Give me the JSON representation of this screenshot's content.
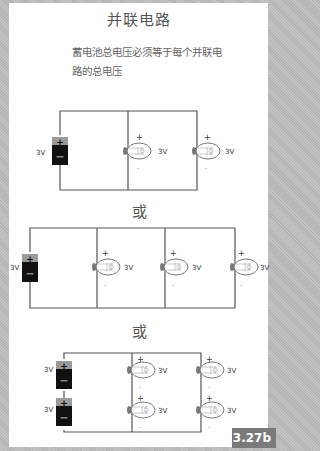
{
  "title": "并联电路",
  "description": "蓄电池总电压必须等于每个并联电路的总电压",
  "separator_label_1": "或",
  "separator_label_2": "或",
  "figure_number": "3.27b",
  "circuits": [
    {
      "name": "circuit-1",
      "batteries": [
        {
          "voltage": "3V"
        }
      ],
      "bulbs": [
        {
          "voltage": "3V"
        },
        {
          "voltage": "3V"
        }
      ]
    },
    {
      "name": "circuit-2",
      "batteries": [
        {
          "voltage": "3V"
        }
      ],
      "bulbs": [
        {
          "voltage": "3V"
        },
        {
          "voltage": "3V"
        },
        {
          "voltage": "3V"
        }
      ]
    },
    {
      "name": "circuit-3",
      "batteries": [
        {
          "voltage": "3V"
        },
        {
          "voltage": "3V"
        }
      ],
      "bulbs": [
        {
          "voltage": "3V"
        },
        {
          "voltage": "3V"
        },
        {
          "voltage": "3V"
        },
        {
          "voltage": "3V"
        }
      ]
    }
  ],
  "polarity": {
    "plus": "+",
    "minus": "-"
  },
  "colors": {
    "wire": "#555555",
    "battery_body": "#111111",
    "battery_cap": "#9a9a9a",
    "bulb_base": "#777777",
    "badge": "#7a7a7a"
  }
}
